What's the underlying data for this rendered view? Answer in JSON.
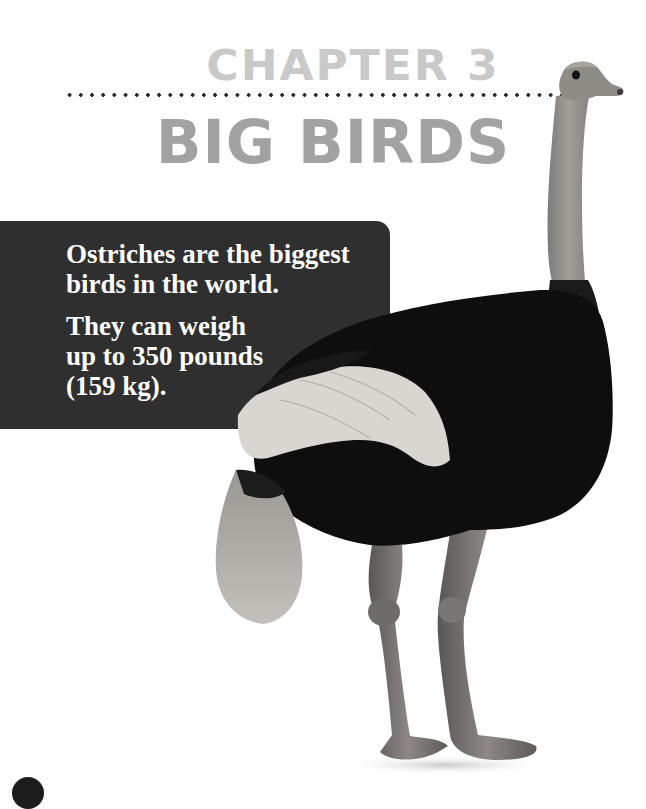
{
  "page": {
    "chapter_label": "CHAPTER 3",
    "chapter_title": "BIG BIRDS",
    "fact_box": {
      "paragraphs": [
        {
          "lines": [
            "Ostriches are the biggest",
            "birds in the world."
          ]
        },
        {
          "lines": [
            "They can weigh",
            "up to 350 pounds",
            "(159 kg)."
          ]
        }
      ]
    },
    "illustration": {
      "subject": "ostrich",
      "icon": "ostrich-photo"
    },
    "page_badge": {
      "icon": "page-number-badge"
    }
  },
  "colors": {
    "background": "#ffffff",
    "chapter_label": "#c9c9c9",
    "chapter_title": "#a2a2a2",
    "dots": "#2a2a2a",
    "fact_box_bg": "#2f2f2f",
    "fact_box_text": "#ffffff",
    "ostrich_body": "#0d0d0d",
    "ostrich_neck_legs": "#8a8683",
    "ostrich_wing": "#d8d6d2"
  }
}
